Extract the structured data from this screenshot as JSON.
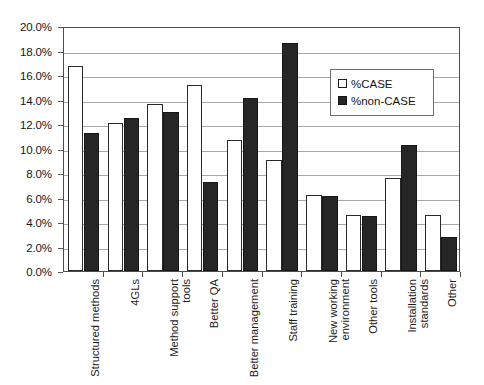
{
  "chart_data": {
    "type": "bar",
    "title": "",
    "subtitle": "",
    "xlabel": "",
    "ylabel": "",
    "ylim": [
      0,
      20
    ],
    "ytick_interval": 2,
    "ytick_labels": [
      "20.0%",
      "18.0%",
      "16.0%",
      "14.0%",
      "12.0%",
      "10.0%",
      "8.0%",
      "6.0%",
      "4.0%",
      "2.0%",
      "0.0%"
    ],
    "ytick_values": [
      20,
      18,
      16,
      14,
      12,
      10,
      8,
      6,
      4,
      2,
      0
    ],
    "grid": true,
    "legend_position": "inside-top-right",
    "categories": [
      "Structured methods",
      "4GLs",
      "Method support tools",
      "Better QA",
      "Better management",
      "Staff training",
      "New working environment",
      "Other tools",
      "Installation standards",
      "Other"
    ],
    "series": [
      {
        "name": "%CASE",
        "color": "#ffffff",
        "edge_color": "#2a2a2a",
        "values": [
          16.7,
          12.1,
          13.6,
          15.2,
          10.7,
          9.1,
          6.2,
          4.6,
          7.6,
          4.6
        ]
      },
      {
        "name": "%non-CASE",
        "color": "#262626",
        "edge_color": "#161616",
        "values": [
          11.3,
          12.5,
          13.0,
          7.3,
          14.1,
          18.6,
          6.1,
          4.5,
          10.3,
          2.8
        ]
      }
    ]
  },
  "legend": {
    "items": [
      {
        "label": "%CASE",
        "swatch": "open-square-swatch"
      },
      {
        "label": "%non-CASE",
        "swatch": "filled-square-swatch"
      }
    ]
  }
}
